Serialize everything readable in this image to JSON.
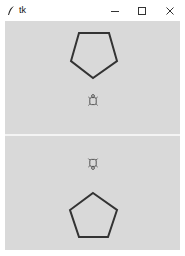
{
  "window": {
    "title": "tk",
    "app_icon": "feather-icon",
    "controls": {
      "minimize": "—",
      "maximize": "☐",
      "close": "✕"
    }
  },
  "colors": {
    "canvas_bg": "#d9d9d9",
    "shape_stroke": "#333333",
    "turtle_stroke": "#555555",
    "divider": "#f4f4f4"
  },
  "canvases": [
    {
      "name": "top-canvas",
      "shape": "pentagon",
      "orientation": "pointing-down",
      "turtle_heading": "up"
    },
    {
      "name": "bottom-canvas",
      "shape": "pentagon",
      "orientation": "pointing-up",
      "turtle_heading": "down"
    }
  ]
}
